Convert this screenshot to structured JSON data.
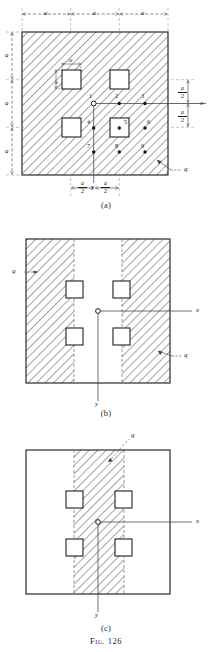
{
  "figure": {
    "caption": "Fig. 126",
    "load_symbol": "q",
    "axis_x": "x",
    "axis_y": "y",
    "hole_width_label": "u",
    "hole_height_label": "v",
    "dim_a": "a",
    "half_a_numerator": "a",
    "half_a_denominator": "2"
  },
  "panels": [
    {
      "caption": "(a)",
      "description": "Square plate fully hatched with four square holes and nine numbered grid points",
      "top_dims": [
        "a",
        "a",
        "a"
      ],
      "left_dims": [
        "a",
        "a",
        "a"
      ],
      "right_dims": [
        "a/2",
        "a/2"
      ],
      "bottom_dims": [
        "a/2",
        "a/2"
      ],
      "points": [
        {
          "id": "1",
          "open": true
        },
        {
          "id": "2",
          "open": false
        },
        {
          "id": "3",
          "open": false
        },
        {
          "id": "4",
          "open": false
        },
        {
          "id": "5",
          "open": false
        },
        {
          "id": "6",
          "open": false
        },
        {
          "id": "7",
          "open": false
        },
        {
          "id": "8",
          "open": false
        },
        {
          "id": "9",
          "open": false
        }
      ],
      "load_labels": [
        "q"
      ]
    },
    {
      "caption": "(b)",
      "description": "Square plate with two outer vertical hatched bands and clear central strip, four square holes",
      "load_labels": [
        "q",
        "q"
      ]
    },
    {
      "caption": "(c)",
      "description": "Square plate with a single central vertical hatched band and clear outer regions, four square holes",
      "load_labels": [
        "q"
      ]
    }
  ]
}
